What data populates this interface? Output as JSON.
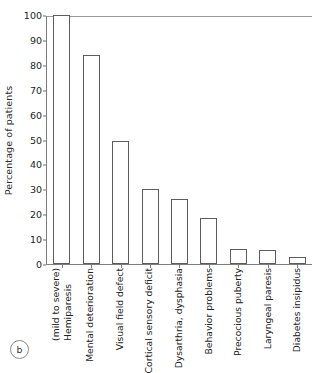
{
  "figure": {
    "panel_letter": "b",
    "ylabel": "Percentage of patients"
  },
  "chart_data": {
    "type": "bar",
    "title": "",
    "xlabel": "",
    "ylabel": "Percentage of patients",
    "ylim": [
      0,
      100
    ],
    "ytick_step": 10,
    "yticks": [
      0,
      10,
      20,
      30,
      40,
      50,
      60,
      70,
      80,
      90,
      100
    ],
    "ytick_labels": [
      "0",
      "10",
      "20",
      "30",
      "40",
      "50",
      "60",
      "70",
      "80",
      "90",
      "100"
    ],
    "grid": false,
    "legend": null,
    "bar_style": {
      "fill": "#ffffff",
      "edge": "#5c5c5c"
    },
    "categories": [
      "Hemiparesis (mild to severe)",
      "Mental deterioration",
      "Visual field defect",
      "Cortical sensory deficit",
      "Dysarthria, dysphasia",
      "Behavior problems",
      "Precocious puberty",
      "Laryngeal paresis",
      "Diabetes insipidus"
    ],
    "category_lines": [
      [
        "Hemiparesis",
        "(mild to severe)"
      ],
      [
        "Mental deterioration"
      ],
      [
        "Visual field defect"
      ],
      [
        "Cortical sensory deficit"
      ],
      [
        "Dysarthria, dysphasia"
      ],
      [
        "Behavior problems"
      ],
      [
        "Precocious puberty"
      ],
      [
        "Laryngeal paresis"
      ],
      [
        "Diabetes insipidus"
      ]
    ],
    "values": [
      100,
      84,
      49.5,
      30,
      26,
      18.5,
      6,
      5.5,
      3
    ]
  }
}
